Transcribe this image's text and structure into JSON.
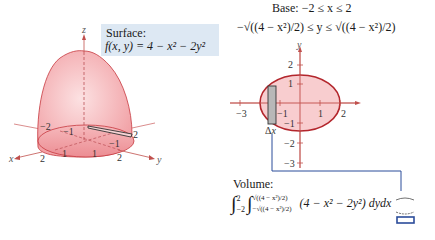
{
  "surface": {
    "label": "Surface:",
    "equation": "f(x, y) = 4 − x² − 2y²"
  },
  "base": {
    "line1": "Base:  −2 ≤ x ≤ 2",
    "line2": "−√((4 − x²)/2) ≤ y ≤ √((4 − x²)/2)"
  },
  "volume": {
    "label": "Volume:",
    "outer_lower": "−2",
    "outer_upper": "2",
    "inner_lower": "−√((4 − x²)/2)",
    "inner_upper": "√((4 − x²)/2)",
    "integrand": "(4 − x² − 2y²) dy",
    "differential": "dx"
  },
  "plot3d": {
    "axis_labels": {
      "x": "x",
      "y": "y",
      "z": "z"
    },
    "ticks": [
      "−2",
      "−1",
      "1",
      "2",
      "−1",
      "1",
      "2",
      "2"
    ]
  },
  "plot2d": {
    "axis_label_y": "y",
    "x_ticks": [
      "−3",
      "−1",
      "1",
      "2"
    ],
    "y_ticks": [
      "2",
      "1",
      "−1",
      "−2",
      "−3"
    ],
    "delta_label": "Δx"
  },
  "colors": {
    "surface_fill": "#f4a9ad",
    "surface_edge": "#c6393f",
    "axis": "#c0504d",
    "label_box": "#dde8f3",
    "connector": "#2b4c9a"
  }
}
